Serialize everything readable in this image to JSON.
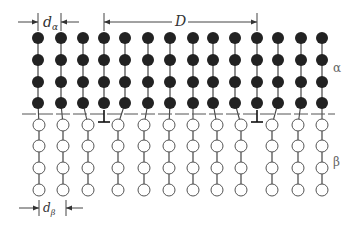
{
  "diagram": {
    "colors": {
      "alpha_atom": "#222222",
      "beta_atom_fill": "#ffffff",
      "beta_atom_stroke": "#555555",
      "lines": "#444444",
      "interface": "#555555"
    },
    "labels": {
      "d_alpha": "d",
      "d_alpha_sub": "α",
      "d_beta": "d",
      "d_beta_sub": "β",
      "D": "D",
      "alpha_phase": "α",
      "beta_phase": "β"
    },
    "alpha_lattice": {
      "columns_x": [
        38,
        61,
        83,
        104,
        125,
        148,
        170,
        193,
        213,
        235,
        257,
        278,
        301,
        322
      ],
      "rows_y": [
        38,
        60,
        82,
        103
      ],
      "radius": 6
    },
    "beta_lattice": {
      "columns_x": [
        39,
        63,
        88,
        118,
        144,
        169,
        193,
        217,
        241,
        272,
        298,
        322
      ],
      "rows_y": [
        125,
        146,
        168,
        190
      ],
      "radius": 6
    },
    "interface": {
      "y": 114,
      "x_start": 22,
      "x_end": 335
    },
    "dislocations": [
      {
        "x": 104,
        "y": 118
      },
      {
        "x": 257,
        "y": 118
      }
    ],
    "dimensions": {
      "d_alpha": {
        "x1": 38,
        "x2": 61,
        "y": 22
      },
      "D": {
        "x1": 104,
        "x2": 257,
        "y": 22
      },
      "d_beta": {
        "x1": 39,
        "x2": 63,
        "y": 208
      }
    }
  }
}
